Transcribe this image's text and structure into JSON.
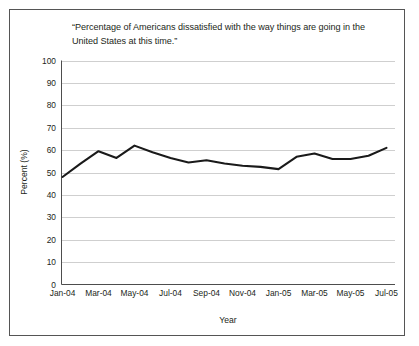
{
  "figure": {
    "title": "“Percentage of Americans dissatisfied with the way things are going in the United States at this time.”",
    "border_color": "#555555",
    "background": "#ffffff"
  },
  "chart_data": {
    "type": "line",
    "title": "“Percentage of Americans dissatisfied with the way things are going in the United States at this time.”",
    "xlabel": "Year",
    "ylabel": "Percent (%)",
    "ylim": [
      0,
      100
    ],
    "ytick_step": 10,
    "yticks": [
      "100",
      "90",
      "80",
      "70",
      "60",
      "50",
      "40",
      "30",
      "20",
      "10",
      "0"
    ],
    "ytick_values": [
      100,
      90,
      80,
      70,
      60,
      50,
      40,
      30,
      20,
      10,
      0
    ],
    "grid": "horizontal",
    "grid_color": "#c9c9c9",
    "legend": "none",
    "line_color": "#1a1a1a",
    "line_width": 2.1,
    "xticks": [
      "Jan-04",
      "Mar-04",
      "May-04",
      "Jul-04",
      "Sep-04",
      "Nov-04",
      "Jan-05",
      "Mar-05",
      "May-05",
      "Jul-05"
    ],
    "x": [
      "Jan-04",
      "Feb-04",
      "Mar-04",
      "Apr-04",
      "May-04",
      "Jun-04",
      "Jul-04",
      "Aug-04",
      "Sep-04",
      "Oct-04",
      "Nov-04",
      "Dec-04",
      "Jan-05",
      "Feb-05",
      "Mar-05",
      "Apr-05",
      "May-05",
      "Jun-05",
      "Jul-05"
    ],
    "categories": [
      "Jan-04",
      "Feb-04",
      "Mar-04",
      "Apr-04",
      "May-04",
      "Jun-04",
      "Jul-04",
      "Aug-04",
      "Sep-04",
      "Oct-04",
      "Nov-04",
      "Dec-04",
      "Jan-05",
      "Feb-05",
      "Mar-05",
      "Apr-05",
      "May-05",
      "Jun-05",
      "Jul-05"
    ],
    "values": [
      48,
      54,
      59.5,
      56.5,
      62,
      59,
      56.5,
      54.5,
      55.5,
      54,
      53,
      52.5,
      51.5,
      57,
      58.5,
      56,
      56,
      57.5,
      61
    ],
    "series": [
      {
        "name": "Percentage dissatisfied",
        "values": [
          48,
          54,
          59.5,
          56.5,
          62,
          59,
          56.5,
          54.5,
          55.5,
          54,
          53,
          52.5,
          51.5,
          57,
          58.5,
          56,
          56,
          57.5,
          61
        ]
      }
    ]
  }
}
